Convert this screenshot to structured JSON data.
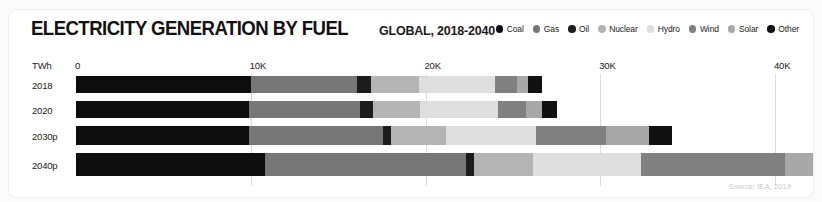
{
  "header": {
    "title": "ELECTRICITY GENERATION BY FUEL",
    "subtitle": "GLOBAL, 2018-2040"
  },
  "source_note": "Source: IEA, 2019",
  "ghost_top_text": "",
  "chart_data": {
    "type": "bar",
    "orientation": "horizontal",
    "stacked": true,
    "title": "ELECTRICITY GENERATION BY FUEL",
    "subtitle": "GLOBAL, 2018-2040",
    "xlabel": "TWh",
    "ylabel": "",
    "unit_label": "TWh",
    "xlim": [
      0,
      42000
    ],
    "xticks": [
      0,
      10000,
      20000,
      30000,
      40000
    ],
    "xtick_labels": [
      "0",
      "10K",
      "20K",
      "30K",
      "40K"
    ],
    "grid": true,
    "legend_position": "top-right",
    "categories": [
      "2018",
      "2020",
      "2030p",
      "2040p"
    ],
    "series": [
      {
        "name": "Coal",
        "color": "#0d0d0d",
        "values": [
          10000,
          9900,
          9900,
          10800
        ]
      },
      {
        "name": "Gas",
        "color": "#777777",
        "values": [
          6100,
          6350,
          7650,
          11500
        ]
      },
      {
        "name": "Oil",
        "color": "#1c1c1c",
        "values": [
          800,
          750,
          450,
          450
        ]
      },
      {
        "name": "Nuclear",
        "color": "#b4b4b4",
        "values": [
          2750,
          2700,
          3200,
          3400
        ]
      },
      {
        "name": "Hydro",
        "color": "#dedede",
        "values": [
          4300,
          4450,
          5150,
          6200
        ]
      },
      {
        "name": "Wind",
        "color": "#808080",
        "values": [
          1300,
          1600,
          4000,
          8200
        ]
      },
      {
        "name": "Solar",
        "color": "#a8a8a8",
        "values": [
          600,
          900,
          2450,
          6300
        ]
      },
      {
        "name": "Other",
        "color": "#111111",
        "values": [
          800,
          900,
          1300,
          1800
        ]
      }
    ],
    "totals": [
      26650,
      27550,
      34100,
      48650
    ],
    "annotations": []
  }
}
